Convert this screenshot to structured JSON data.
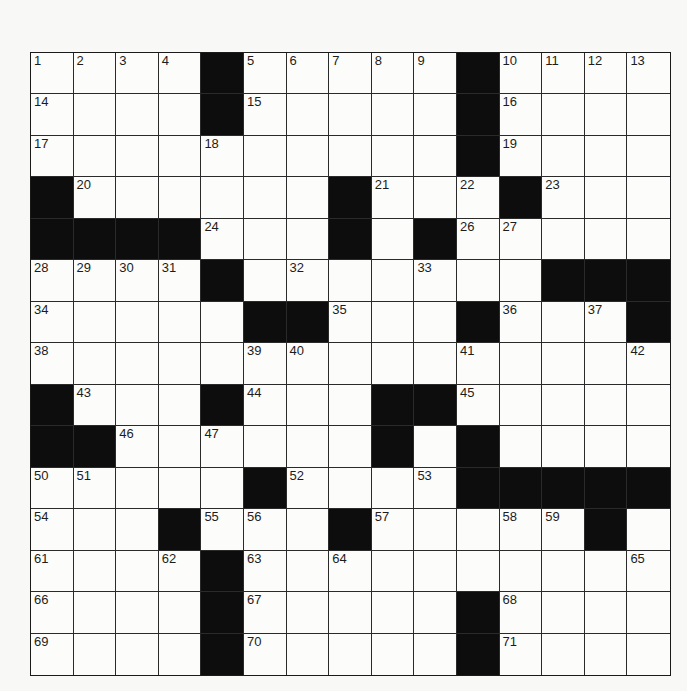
{
  "puzzle": {
    "rows": 15,
    "cols": 15,
    "colors": {
      "block": "#0d0d0d",
      "cell": "#fcfcfb",
      "line": "#2a2a2a",
      "number": "#1c1c1c",
      "background": "#f8f8f6"
    },
    "layout": [
      "....#.....#....",
      "....#.....#....",
      "..........#....",
      "#......#...#...",
      "####...#.#.....",
      "....#.......###",
      ".....##...#...#",
      "...............",
      "#...#...##.....",
      "##......#.#....",
      ".....#....#####",
      "...#...#.....#.",
      "....#..........",
      "....#.....#....",
      "....#.....#...."
    ],
    "numbers": [
      [
        1,
        2,
        3,
        4,
        0,
        5,
        6,
        7,
        8,
        9,
        0,
        10,
        11,
        12,
        13
      ],
      [
        14,
        0,
        0,
        0,
        0,
        15,
        0,
        0,
        0,
        0,
        0,
        16,
        0,
        0,
        0
      ],
      [
        17,
        0,
        0,
        0,
        18,
        0,
        0,
        0,
        0,
        0,
        0,
        19,
        0,
        0,
        0
      ],
      [
        0,
        20,
        0,
        0,
        0,
        0,
        0,
        0,
        21,
        0,
        22,
        0,
        23,
        0,
        0
      ],
      [
        0,
        0,
        0,
        0,
        24,
        0,
        0,
        25,
        0,
        0,
        26,
        27,
        0,
        0,
        0
      ],
      [
        28,
        29,
        30,
        31,
        0,
        0,
        32,
        0,
        0,
        33,
        0,
        0,
        0,
        0,
        0
      ],
      [
        34,
        0,
        0,
        0,
        0,
        0,
        0,
        35,
        0,
        0,
        0,
        36,
        0,
        37,
        0
      ],
      [
        38,
        0,
        0,
        0,
        0,
        39,
        40,
        0,
        0,
        0,
        41,
        0,
        0,
        0,
        42
      ],
      [
        0,
        43,
        0,
        0,
        0,
        44,
        0,
        0,
        0,
        0,
        45,
        0,
        0,
        0,
        0
      ],
      [
        0,
        0,
        46,
        0,
        47,
        0,
        0,
        0,
        48,
        0,
        49,
        0,
        0,
        0,
        0
      ],
      [
        50,
        51,
        0,
        0,
        0,
        0,
        52,
        0,
        0,
        53,
        0,
        0,
        0,
        0,
        0
      ],
      [
        54,
        0,
        0,
        0,
        55,
        56,
        0,
        0,
        57,
        0,
        0,
        58,
        59,
        60,
        0
      ],
      [
        61,
        0,
        0,
        62,
        0,
        63,
        0,
        64,
        0,
        0,
        0,
        0,
        0,
        0,
        65
      ],
      [
        66,
        0,
        0,
        0,
        0,
        67,
        0,
        0,
        0,
        0,
        0,
        68,
        0,
        0,
        0
      ],
      [
        69,
        0,
        0,
        0,
        0,
        70,
        0,
        0,
        0,
        0,
        0,
        71,
        0,
        0,
        0
      ]
    ]
  }
}
